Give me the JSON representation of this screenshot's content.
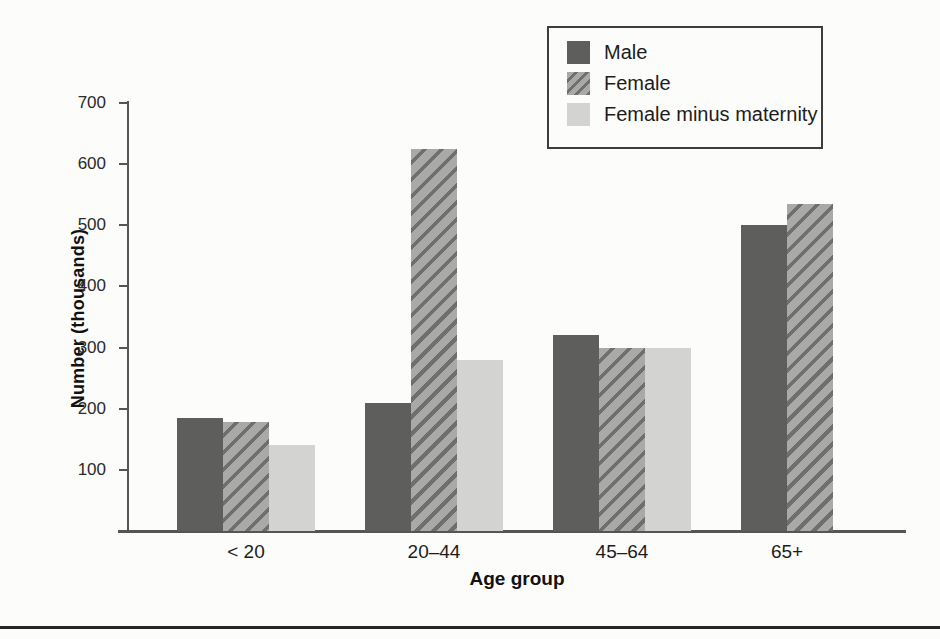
{
  "chart_data": {
    "type": "bar",
    "title": "",
    "xlabel": "Age group",
    "ylabel": "Number (thousands)",
    "ylim": [
      0,
      700
    ],
    "yticks": [
      100,
      200,
      300,
      400,
      500,
      600,
      700
    ],
    "grid": false,
    "legend_position": "top-right",
    "categories": [
      "< 20",
      "20–44",
      "45–64",
      "65+"
    ],
    "series": [
      {
        "key": "male",
        "name": "Male",
        "pattern": "solid-dark",
        "values": [
          185,
          210,
          320,
          500
        ]
      },
      {
        "key": "female",
        "name": "Female",
        "pattern": "diagonal-hatch",
        "values": [
          178,
          625,
          300,
          535
        ]
      },
      {
        "key": "female-minus-maternity",
        "name": "Female minus maternity",
        "pattern": "solid-light",
        "values": [
          140,
          280,
          300,
          null
        ]
      }
    ]
  },
  "colors": {
    "male_bar": "#5e5e5c",
    "female_hatch_base": "#a9a9a7",
    "female_hatch_stripe": "#6f6f6d",
    "female_minus_maternity_bar": "#d3d3d1",
    "axis": "#555552",
    "text": "#1c1c1c",
    "background": "#fcfcfa",
    "bottom_rule": "#262624"
  }
}
